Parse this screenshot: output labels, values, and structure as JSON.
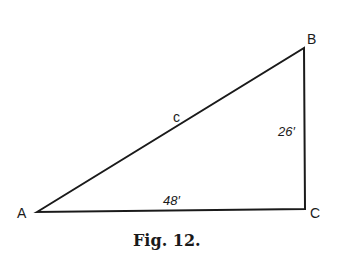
{
  "figure": {
    "caption": "Fig. 12.",
    "vertices": {
      "A": "A",
      "B": "B",
      "C": "C"
    },
    "sides": {
      "hypotenuse": "c",
      "vertical": "26′",
      "base": "48′"
    }
  }
}
